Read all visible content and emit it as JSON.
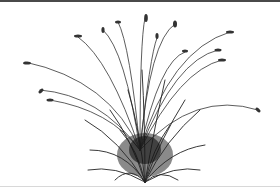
{
  "image": {
    "subject": "ornamental grass clump illustration",
    "background_color": "#ffffff",
    "ink_color": "#2a2a2a",
    "top_border_color": "#4a4a4a",
    "ground_line_color": "#d8d8d8"
  }
}
